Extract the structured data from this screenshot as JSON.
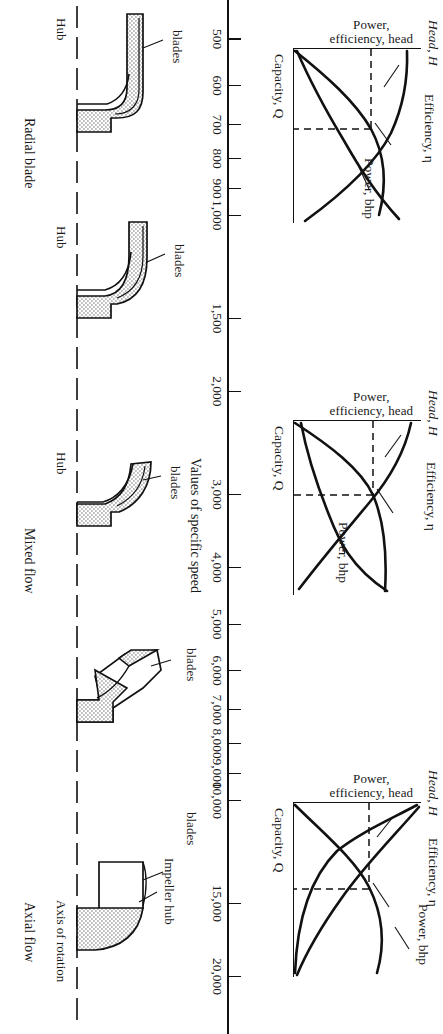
{
  "figure": {
    "axis_title": "Values of specific speed",
    "axis_name": "Capacity, Q"
  },
  "chart_data": [
    {
      "type": "line",
      "title": "Radial blade pump performance",
      "xlabel": "Capacity, Q",
      "ylabel": "Power, efficiency, head",
      "series": [
        {
          "name": "Head, H",
          "label": "Head, H"
        },
        {
          "name": "Efficiency, η",
          "label": "Efficiency, η"
        },
        {
          "name": "Power, bhp",
          "label": "Power, bhp"
        }
      ],
      "grid": false,
      "legend": "inline-annotations",
      "notes": "Head falls steeply with capacity; efficiency peaks then drops; power rises then flattens. Dashed lines mark best efficiency point."
    },
    {
      "type": "line",
      "title": "Mixed flow pump performance",
      "xlabel": "Capacity, Q",
      "ylabel": "Power, efficiency, head",
      "series": [
        {
          "name": "Head, H",
          "label": "Head, H"
        },
        {
          "name": "Efficiency, η",
          "label": "Efficiency, η"
        },
        {
          "name": "Power, bhp",
          "label": "Power, bhp"
        }
      ],
      "grid": false,
      "legend": "inline-annotations",
      "notes": "Head droops gradually; efficiency flat-topped; power nearly constant."
    },
    {
      "type": "line",
      "title": "Axial flow pump performance",
      "xlabel": "Capacity, Q",
      "ylabel": "Power, efficiency, head",
      "series": [
        {
          "name": "Head, H",
          "label": "Head, H"
        },
        {
          "name": "Efficiency, η",
          "label": "Efficiency, η"
        },
        {
          "name": "Power, bhp",
          "label": "Power, bhp"
        }
      ],
      "grid": false,
      "legend": "inline-annotations",
      "notes": "Head drops very steeply at low capacity; power decreases with capacity; efficiency peaks near design point."
    }
  ],
  "specific_speed_axis": {
    "title": "Values of specific speed",
    "ticks": [
      {
        "value": 500,
        "label": "500"
      },
      {
        "value": 600,
        "label": "600"
      },
      {
        "value": 700,
        "label": "700"
      },
      {
        "value": 800,
        "label": "800"
      },
      {
        "value": 900,
        "label": "900"
      },
      {
        "value": 1000,
        "label": "1,000"
      },
      {
        "value": 1500,
        "label": "1,500"
      },
      {
        "value": 2000,
        "label": "2,000"
      },
      {
        "value": 3000,
        "label": "3,000"
      },
      {
        "value": 4000,
        "label": "4,000"
      },
      {
        "value": 5000,
        "label": "5,000"
      },
      {
        "value": 6000,
        "label": "6,000"
      },
      {
        "value": 7000,
        "label": "7,000"
      },
      {
        "value": 8000,
        "label": "8,000"
      },
      {
        "value": 9000,
        "label": "9,000"
      },
      {
        "value": 10000,
        "label": "10,000"
      },
      {
        "value": 15000,
        "label": "15,000"
      },
      {
        "value": 20000,
        "label": "20,000"
      }
    ],
    "min": 460,
    "max": 23000
  },
  "charts": [
    {
      "id": "radial",
      "ylabel_line1": "Power,",
      "ylabel_line2": "efficiency, head",
      "xlabel": "Capacity, Q",
      "head_label": "Head, H",
      "eff_label": "Efficiency, η",
      "power_label": "Power, bhp"
    },
    {
      "id": "mixed",
      "ylabel_line1": "Power,",
      "ylabel_line2": "efficiency, head",
      "xlabel": "Capacity, Q",
      "head_label": "Head, H",
      "eff_label": "Efficiency, η",
      "power_label": "Power, bhp"
    },
    {
      "id": "axial",
      "ylabel_line1": "Power,",
      "ylabel_line2": "efficiency, head",
      "xlabel": "Capacity, Q",
      "head_label": "Head, H",
      "eff_label": "Efficiency, η",
      "power_label": "Power, bhp"
    }
  ],
  "impellers": [
    {
      "id": "radial-1",
      "hub": "Hub",
      "blades": "blades"
    },
    {
      "id": "radial-2",
      "hub": "Hub",
      "blades": "blades"
    },
    {
      "id": "mixed-1",
      "hub": "Hub",
      "blades": "blades"
    },
    {
      "id": "mixed-2",
      "hub": "",
      "blades": "blades"
    },
    {
      "id": "axial-1",
      "hub": "Impeller hub",
      "blades": "blades"
    }
  ],
  "flow_labels": [
    {
      "id": "radial",
      "label": "Radial blade"
    },
    {
      "id": "mixed",
      "label": "Mixed flow"
    },
    {
      "id": "axial",
      "label": "Axial flow"
    }
  ],
  "annotations": {
    "axis_of_rotation": "Axis of rotation",
    "impeller_hub": "Impeller hub",
    "hub": "Hub",
    "blades": "blades"
  },
  "colors": {
    "ink": "#111111",
    "hatch": "#b8b8b8",
    "paper": "#ffffff"
  }
}
